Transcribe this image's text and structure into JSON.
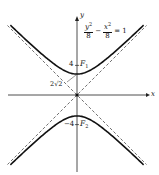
{
  "diagram": {
    "type": "hyperbola",
    "equation": {
      "y_num": "y",
      "y_den": "8",
      "minus": "−",
      "x_num": "x",
      "x_den": "8",
      "equals": "= 1",
      "exp": "2"
    },
    "axes": {
      "x_label": "x",
      "y_label": "y"
    },
    "origin_px": [
      77,
      95
    ],
    "scale_px_per_unit": 7.4,
    "a": 2.828,
    "x_range": [
      -9,
      9
    ],
    "vertex_label": "2√2",
    "foci": [
      {
        "name": "F",
        "sub": "1",
        "value_label": "4",
        "y": 4
      },
      {
        "name": "F",
        "sub": "2",
        "value_label": "−4",
        "y": -4
      }
    ],
    "asymptotes": [
      "y = x",
      "y = −x"
    ],
    "colors": {
      "curve": "#111111",
      "axis": "#222222",
      "asymptote": "#333333",
      "background": "#ffffff"
    }
  }
}
